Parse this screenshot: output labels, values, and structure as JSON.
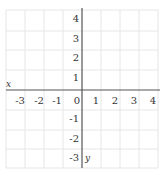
{
  "diagram": {
    "type": "coordinate-plane",
    "x_axis": {
      "label": "x",
      "ticks": [
        "-3",
        "-2",
        "-1",
        "0",
        "1",
        "2",
        "3",
        "4"
      ],
      "range": [
        -3,
        4
      ]
    },
    "y_axis": {
      "label": "y",
      "ticks_positive": [
        "4",
        "3",
        "2",
        "1"
      ],
      "ticks_negative": [
        "-1",
        "-2",
        "-3"
      ],
      "range": [
        -3,
        4
      ]
    },
    "colors": {
      "grid": "#e6e6e6",
      "axis": "#555555",
      "text": "#333333"
    }
  }
}
